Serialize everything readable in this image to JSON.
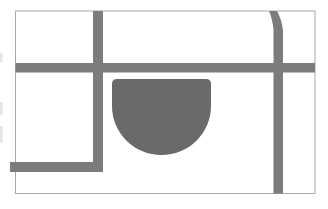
{
  "meta": {
    "width_px": 328,
    "height_px": 209
  },
  "colors": {
    "background": "#ffffff",
    "frame_border": "#a9a9a9",
    "road": "#7c7c7c",
    "footprint": "#6a6a6a",
    "edge_artifact": "#e4e4e4"
  },
  "map": {
    "frame": {
      "x": 15.5,
      "y": 11,
      "width": 299.5,
      "height": 182.5
    },
    "roads": [
      {
        "id": "main-horizontal-road",
        "orientation": "horizontal",
        "from_x": 15.5,
        "to_x": 315,
        "y": 63,
        "thickness": 9.5
      },
      {
        "id": "left-vertical-road",
        "orientation": "vertical",
        "x": 93,
        "from_y": 11,
        "to_y": 172,
        "thickness": 10
      },
      {
        "id": "bottom-left-horizontal-road",
        "orientation": "horizontal",
        "from_x": 10,
        "to_x": 103,
        "y": 162,
        "thickness": 10,
        "note": "forms an L-corner with the left vertical road"
      },
      {
        "id": "right-vertical-road",
        "orientation": "vertical",
        "x": 273.5,
        "from_y": 11,
        "to_y": 193.5,
        "thickness": 9.5,
        "note": "slight rightward bend near the top edge"
      }
    ],
    "footprint": {
      "id": "building-footprint",
      "shape": "rectangle with rounded top corners and semicircular bottom",
      "x": 112,
      "y": 79,
      "width": 99,
      "height": 76
    },
    "edge_artifacts": [
      {
        "id": "left-edge-mark-1",
        "x": 0,
        "y": 53,
        "width": 2.5,
        "height": 9
      },
      {
        "id": "left-edge-mark-2",
        "x": 0,
        "y": 102,
        "width": 2.5,
        "height": 13
      },
      {
        "id": "left-edge-mark-3",
        "x": 0,
        "y": 126,
        "width": 2.5,
        "height": 17
      }
    ]
  }
}
